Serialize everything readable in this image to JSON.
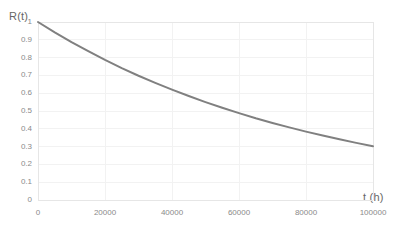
{
  "chart_data": {
    "type": "line",
    "title": "",
    "subtitle": "",
    "xlabel": "t (h)",
    "ylabel": "R(t)",
    "xlim": [
      0,
      100000
    ],
    "ylim": [
      0,
      1
    ],
    "grid": true,
    "legend": null,
    "x_ticks": [
      0,
      20000,
      40000,
      60000,
      80000,
      100000
    ],
    "x_tick_labels": [
      "0",
      "20000",
      "40000",
      "60000",
      "80000",
      "100000"
    ],
    "y_ticks": [
      0,
      0.1,
      0.2,
      0.3,
      0.4,
      0.5,
      0.6,
      0.7,
      0.8,
      0.9,
      1
    ],
    "y_tick_labels": [
      "0",
      "0.1",
      "0.2",
      "0.3",
      "0.4",
      "0.5",
      "0.6",
      "0.7",
      "0.8",
      "0.9",
      "1"
    ],
    "series": [
      {
        "name": "R(t)",
        "color": "#808080",
        "line_width": 2,
        "x": [
          0,
          5000,
          10000,
          15000,
          20000,
          25000,
          30000,
          35000,
          40000,
          45000,
          50000,
          55000,
          60000,
          65000,
          70000,
          75000,
          80000,
          85000,
          90000,
          95000,
          100000
        ],
        "y": [
          1.0,
          0.942,
          0.887,
          0.836,
          0.787,
          0.741,
          0.698,
          0.658,
          0.62,
          0.584,
          0.55,
          0.518,
          0.488,
          0.459,
          0.433,
          0.408,
          0.384,
          0.362,
          0.341,
          0.321,
          0.302
        ]
      }
    ],
    "annotations": []
  },
  "plot_geometry": {
    "left": 38,
    "right": 373,
    "top": 22,
    "bottom": 200
  },
  "colors": {
    "curve": "#808080",
    "grid": "#f2f2f2",
    "axis": "#e6e6e6",
    "tick_text": "#8a8a8a",
    "title_text": "#666666",
    "background": "#ffffff"
  }
}
